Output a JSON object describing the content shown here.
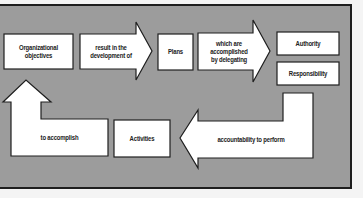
{
  "diagram": {
    "type": "flow",
    "colors": {
      "panel": "#9c9c9c",
      "box": "#ffffff",
      "stroke": "#1e1e1e",
      "background": "#f4f4f4"
    },
    "nodes": [
      {
        "id": "objectives",
        "label": "Organizational objectives",
        "shape": "box"
      },
      {
        "id": "arrow1",
        "label": "result in the development of",
        "shape": "arrow-right"
      },
      {
        "id": "plans",
        "label": "Plans",
        "shape": "box"
      },
      {
        "id": "arrow2",
        "label": "which are accomplished by delegating",
        "shape": "arrow-right"
      },
      {
        "id": "authority",
        "label": "Authority",
        "shape": "box"
      },
      {
        "id": "responsibility",
        "label": "Responsibility",
        "shape": "box"
      },
      {
        "id": "arrow3",
        "label": "accountability to perform",
        "shape": "arrow-left-elbow"
      },
      {
        "id": "activities",
        "label": "Activities",
        "shape": "box"
      },
      {
        "id": "accomplish",
        "label": "to accomplish",
        "shape": "box-arrow-up"
      }
    ],
    "edges": [
      {
        "from": "objectives",
        "to": "plans",
        "via": "arrow1"
      },
      {
        "from": "plans",
        "to": "authority",
        "via": "arrow2"
      },
      {
        "from": "plans",
        "to": "responsibility",
        "via": "arrow2"
      },
      {
        "from": "responsibility",
        "to": "activities",
        "via": "arrow3"
      },
      {
        "from": "activities",
        "to": "objectives",
        "via": "accomplish"
      }
    ]
  },
  "labels": {
    "objectives_1": "Organizational",
    "objectives_2": "objectives",
    "arrow1_1": "result in the",
    "arrow1_2": "development of",
    "plans": "Plans",
    "arrow2_1": "which are",
    "arrow2_2": "accomplished",
    "arrow2_3": "by delegating",
    "authority": "Authority",
    "responsibility": "Responsibility",
    "arrow3": "accountability to perform",
    "activities": "Activities",
    "accomplish": "to accomplish"
  }
}
